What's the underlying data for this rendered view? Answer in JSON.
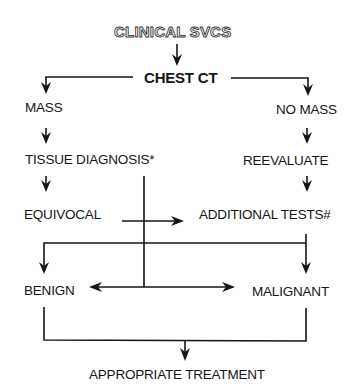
{
  "diagram": {
    "type": "flowchart",
    "nodes": {
      "start": "CLINICAL SVCS",
      "chest_ct": "CHEST CT",
      "mass": "MASS",
      "no_mass": "NO MASS",
      "tissue_diagnosis": "TISSUE DIAGNOSIS*",
      "reevaluate": "REEVALUATE",
      "equivocal": "EQUIVOCAL",
      "additional_tests": "ADDITIONAL TESTS#",
      "benign": "BENIGN",
      "malignant": "MALIGNANT",
      "treatment": "APPROPRIATE TREATMENT"
    },
    "edges": [
      {
        "from": "CLINICAL SVCS",
        "to": "CHEST CT"
      },
      {
        "from": "CHEST CT",
        "to": "MASS"
      },
      {
        "from": "CHEST CT",
        "to": "NO MASS"
      },
      {
        "from": "MASS",
        "to": "TISSUE DIAGNOSIS*"
      },
      {
        "from": "NO MASS",
        "to": "REEVALUATE"
      },
      {
        "from": "TISSUE DIAGNOSIS*",
        "to": "EQUIVOCAL"
      },
      {
        "from": "REEVALUATE",
        "to": "ADDITIONAL TESTS#"
      },
      {
        "from": "EQUIVOCAL",
        "to": "ADDITIONAL TESTS#"
      },
      {
        "from": "ADDITIONAL TESTS#",
        "to": "BENIGN"
      },
      {
        "from": "ADDITIONAL TESTS#",
        "to": "MALIGNANT"
      },
      {
        "from": "TISSUE DIAGNOSIS*",
        "to": "BENIGN"
      },
      {
        "from": "TISSUE DIAGNOSIS*",
        "to": "MALIGNANT"
      },
      {
        "from": "BENIGN",
        "to": "APPROPRIATE TREATMENT"
      },
      {
        "from": "MALIGNANT",
        "to": "APPROPRIATE TREATMENT"
      }
    ]
  }
}
